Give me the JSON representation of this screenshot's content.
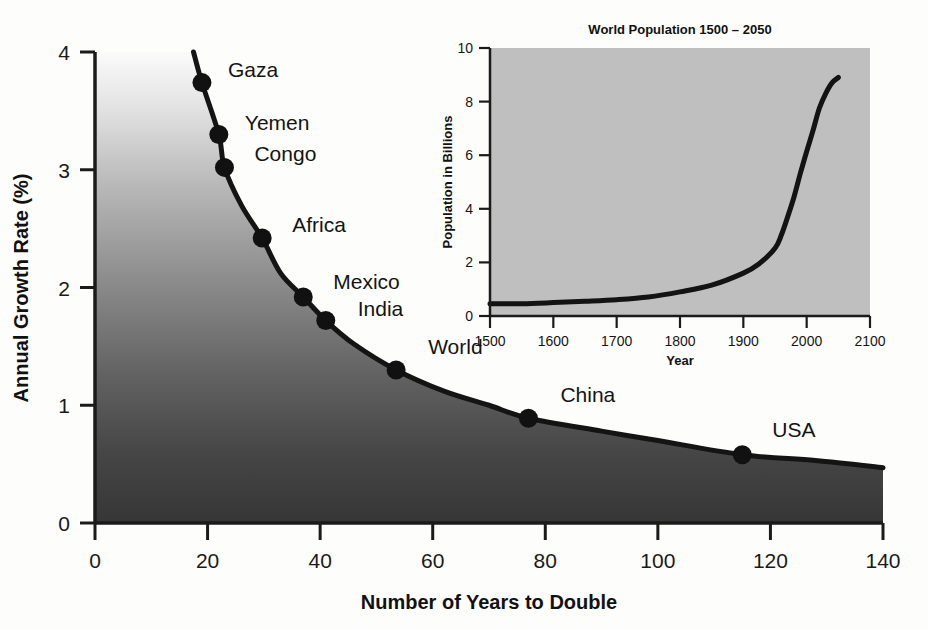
{
  "chart_data": [
    {
      "id": "doubling-time",
      "type": "line",
      "title": "",
      "xlabel": "Number of Years to Double",
      "ylabel": "Annual Growth Rate (%)",
      "xlim": [
        0,
        140
      ],
      "ylim": [
        0,
        4
      ],
      "xticks": [
        0,
        20,
        40,
        60,
        80,
        100,
        120,
        140
      ],
      "yticks": [
        0,
        1,
        2,
        3,
        4
      ],
      "xtick_labels": [
        "0",
        "20",
        "40",
        "60",
        "80",
        "100",
        "120",
        "140"
      ],
      "ytick_labels": [
        "0",
        "1",
        "2",
        "3",
        "4"
      ],
      "grid": false,
      "legend": "none",
      "curve_relation": "rate = 70 / years",
      "curve_points": [
        {
          "x": 17.5,
          "y": 4.0
        },
        {
          "x": 19.0,
          "y": 3.74
        },
        {
          "x": 22.0,
          "y": 3.3
        },
        {
          "x": 23.0,
          "y": 3.02
        },
        {
          "x": 26.0,
          "y": 2.7
        },
        {
          "x": 29.7,
          "y": 2.42
        },
        {
          "x": 33.0,
          "y": 2.12
        },
        {
          "x": 37.0,
          "y": 1.92
        },
        {
          "x": 41.0,
          "y": 1.72
        },
        {
          "x": 46.0,
          "y": 1.52
        },
        {
          "x": 53.5,
          "y": 1.3
        },
        {
          "x": 62.0,
          "y": 1.12
        },
        {
          "x": 70.0,
          "y": 1.0
        },
        {
          "x": 77.0,
          "y": 0.89
        },
        {
          "x": 90.0,
          "y": 0.78
        },
        {
          "x": 100.0,
          "y": 0.7
        },
        {
          "x": 115.0,
          "y": 0.58
        },
        {
          "x": 128.0,
          "y": 0.53
        },
        {
          "x": 140.0,
          "y": 0.47
        }
      ],
      "labeled_points": [
        {
          "label": "Gaza",
          "x": 19.0,
          "y": 3.74,
          "label_dx": 26,
          "label_dy": -6
        },
        {
          "label": "Yemen",
          "x": 22.0,
          "y": 3.3,
          "label_dx": 26,
          "label_dy": -4
        },
        {
          "label": "Congo",
          "x": 23.0,
          "y": 3.02,
          "label_dx": 30,
          "label_dy": -6
        },
        {
          "label": "Africa",
          "x": 29.7,
          "y": 2.42,
          "label_dx": 30,
          "label_dy": -6
        },
        {
          "label": "Mexico",
          "x": 37.0,
          "y": 1.92,
          "label_dx": 30,
          "label_dy": -8
        },
        {
          "label": "India",
          "x": 41.0,
          "y": 1.72,
          "label_dx": 32,
          "label_dy": -4
        },
        {
          "label": "World",
          "x": 53.5,
          "y": 1.3,
          "label_dx": 32,
          "label_dy": -16
        },
        {
          "label": "China",
          "x": 77.0,
          "y": 0.89,
          "label_dx": 32,
          "label_dy": -16
        },
        {
          "label": "USA",
          "x": 115.0,
          "y": 0.58,
          "label_dx": 30,
          "label_dy": -18
        }
      ]
    },
    {
      "id": "world-population-inset",
      "type": "line",
      "title": "World Population 1500 – 2050",
      "xlabel": "Year",
      "ylabel": "Population in Billions",
      "xlim": [
        1500,
        2100
      ],
      "ylim": [
        0,
        10
      ],
      "xticks": [
        1500,
        1600,
        1700,
        1800,
        1900,
        2000,
        2100
      ],
      "yticks": [
        0,
        2,
        4,
        6,
        8,
        10
      ],
      "xtick_labels": [
        "1500",
        "1600",
        "1700",
        "1800",
        "1900",
        "2000",
        "2100"
      ],
      "ytick_labels": [
        "0",
        "2",
        "4",
        "6",
        "8",
        "10"
      ],
      "grid": false,
      "legend": "none",
      "plot_background": "#bfbfbf",
      "x": [
        1500,
        1550,
        1600,
        1650,
        1700,
        1750,
        1800,
        1850,
        1900,
        1925,
        1950,
        1960,
        1970,
        1980,
        1990,
        2000,
        2010,
        2020,
        2030,
        2040,
        2050
      ],
      "y": [
        0.46,
        0.46,
        0.5,
        0.55,
        0.61,
        0.71,
        0.9,
        1.15,
        1.6,
        1.95,
        2.53,
        3.02,
        3.7,
        4.44,
        5.32,
        6.14,
        6.92,
        7.75,
        8.3,
        8.7,
        8.9
      ]
    }
  ],
  "main": {
    "axis": {
      "x_title": "Number of Years to Double",
      "y_title": "Annual Growth Rate (%)"
    }
  },
  "inset": {
    "title": "World Population 1500 – 2050",
    "x_title": "Year",
    "y_title": "Population in Billions"
  },
  "colors": {
    "curve": "#141414",
    "marker": "#111111",
    "axis": "#1b1b1b",
    "fill_top": "#f6f6f6",
    "fill_bottom": "#3a3a3a",
    "inset_panel": "#bfbfbf",
    "page_background": "#fdfdfb"
  }
}
